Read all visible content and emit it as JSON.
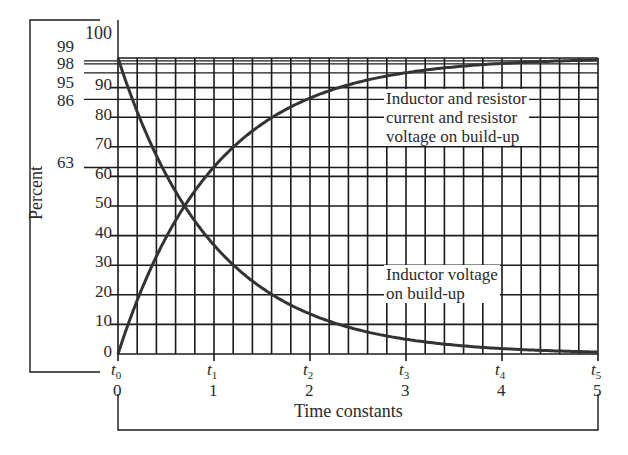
{
  "chart_data": {
    "type": "line",
    "title": "",
    "xlabel": "Time constants",
    "ylabel": "Percent",
    "xlim": [
      0,
      5
    ],
    "ylim": [
      0,
      100
    ],
    "grid": true,
    "x_ticks": [
      0,
      1,
      2,
      3,
      4,
      5
    ],
    "x_tick_labels_top": [
      "t0",
      "t1",
      "t2",
      "t3",
      "t4",
      "t5"
    ],
    "x_minor_step": 0.2,
    "y_ticks": [
      0,
      10,
      20,
      30,
      40,
      50,
      60,
      70,
      80,
      90,
      100
    ],
    "y_extra_reference_lines": [
      63,
      86,
      95,
      98,
      99
    ],
    "x": [
      0,
      0.5,
      1,
      1.5,
      2,
      2.5,
      3,
      3.5,
      4,
      4.5,
      5
    ],
    "series": [
      {
        "name": "Inductor and resistor current and resistor voltage on build-up",
        "values": [
          0,
          39,
          63,
          78,
          86,
          92,
          95,
          97,
          98,
          99,
          99
        ]
      },
      {
        "name": "Inductor voltage on build-up",
        "values": [
          100,
          61,
          37,
          22,
          14,
          8,
          5,
          3,
          2,
          1,
          1
        ]
      }
    ],
    "annotations": [
      "Inductor and resistor current and resistor voltage on build-up",
      "Inductor voltage on build-up"
    ]
  },
  "labels": {
    "ylabel": "Percent",
    "xlabel": "Time constants",
    "y_main": [
      "100",
      "90",
      "80",
      "70",
      "60",
      "50",
      "40",
      "30",
      "20",
      "10",
      "0"
    ],
    "y_extra": [
      "99",
      "98",
      "95",
      "86",
      "63"
    ],
    "t_symbols": [
      "t",
      "t",
      "t",
      "t",
      "t",
      "t"
    ],
    "t_subs": [
      "0",
      "1",
      "2",
      "3",
      "4",
      "5"
    ],
    "x_nums": [
      "0",
      "1",
      "2",
      "3",
      "4",
      "5"
    ],
    "annot_rise": [
      "Inductor and resistor",
      "current and resistor",
      "voltage on build-up"
    ],
    "annot_decay": [
      "Inductor voltage",
      "on build-up"
    ]
  }
}
